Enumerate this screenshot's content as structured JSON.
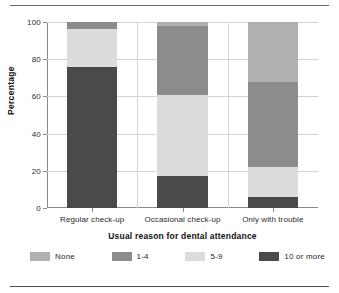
{
  "chart_data": {
    "type": "bar",
    "subtype": "stacked-bar-100",
    "title": "",
    "xlabel": "Usual reason for dental attendance",
    "ylabel": "Percentage",
    "categories": [
      "Regular check-up",
      "Occasional check-up",
      "Only with trouble"
    ],
    "series": [
      {
        "name": "None",
        "values": [
          0,
          2,
          32
        ],
        "color": "#b0b0b0"
      },
      {
        "name": "1-4",
        "values": [
          4,
          37,
          46
        ],
        "color": "#8c8c8c"
      },
      {
        "name": "5-9",
        "values": [
          20,
          44,
          16
        ],
        "color": "#dcdcdc"
      },
      {
        "name": "10 or more",
        "values": [
          76,
          17,
          6
        ],
        "color": "#4a4a4a"
      }
    ],
    "stack_order_bottom_to_top": [
      "10 or more",
      "5-9",
      "1-4",
      "None"
    ],
    "ylim": [
      0,
      100
    ],
    "yticks": [
      0,
      20,
      40,
      60,
      80,
      100
    ],
    "ytick_labels": [
      "0",
      "20",
      "40",
      "60",
      "80",
      "100"
    ],
    "grid": true,
    "grid_axis": "y",
    "legend_position": "bottom"
  },
  "axes": {
    "y_title": "Percentage",
    "x_title": "Usual reason for dental attendance",
    "y_ticks": [
      {
        "value": 100,
        "label": "100"
      },
      {
        "value": 80,
        "label": "80"
      },
      {
        "value": 60,
        "label": "60"
      },
      {
        "value": 40,
        "label": "40"
      },
      {
        "value": 20,
        "label": "20"
      },
      {
        "value": 0,
        "label": "0"
      }
    ],
    "x_ticks": [
      {
        "label": "Regular check-up"
      },
      {
        "label": "Occasional check-up"
      },
      {
        "label": "Only with trouble"
      }
    ]
  },
  "legend": {
    "items": [
      {
        "label": "None",
        "color": "#b0b0b0"
      },
      {
        "label": "1-4",
        "color": "#8c8c8c"
      },
      {
        "label": "5-9",
        "color": "#dcdcdc"
      },
      {
        "label": "10 or more",
        "color": "#4a4a4a"
      }
    ]
  }
}
